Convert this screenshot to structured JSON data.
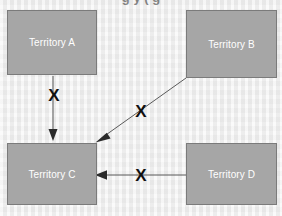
{
  "slide": {
    "title_partial": "g                               y  (    g",
    "background_color": "#ededed"
  },
  "diagram": {
    "box_fill_color": "#a6a6a6",
    "box_border_color": "#7b7b7b",
    "box_text_color": "#ffffff",
    "edge_color": "#5a5a5a",
    "cross_color": "#111111",
    "nodes": [
      {
        "id": "a",
        "label": "Territory A"
      },
      {
        "id": "b",
        "label": "Territory B"
      },
      {
        "id": "c",
        "label": "Territory C"
      },
      {
        "id": "d",
        "label": "Territory D"
      }
    ],
    "edges": [
      {
        "id": "ac",
        "from": "Territory A",
        "to": "Territory C",
        "marker": "X",
        "blocked": "true"
      },
      {
        "id": "bc",
        "from": "Territory B",
        "to": "Territory C",
        "marker": "X",
        "blocked": "true"
      },
      {
        "id": "dc",
        "from": "Territory D",
        "to": "Territory C",
        "marker": "X",
        "blocked": "true"
      }
    ]
  }
}
